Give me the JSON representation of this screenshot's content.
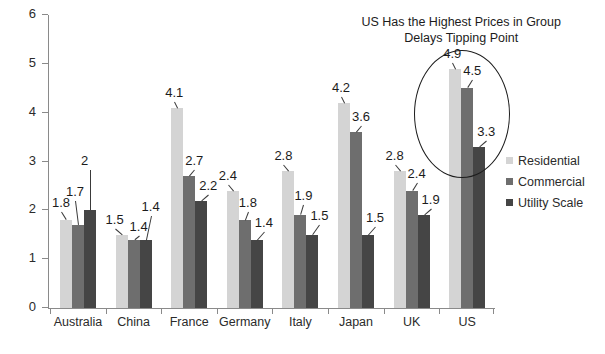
{
  "chart_data": {
    "type": "bar",
    "title": "",
    "xlabel": "",
    "ylabel": "",
    "ylim": [
      0,
      6
    ],
    "ytick_labels": [
      "0",
      "1",
      "2",
      "3",
      "4",
      "5",
      "6"
    ],
    "ytick_values": [
      0,
      1,
      2,
      3,
      4,
      5,
      6
    ],
    "grid": false,
    "legend_position": "right",
    "categories": [
      "Australia",
      "China",
      "France",
      "Germany",
      "Italy",
      "Japan",
      "UK",
      "US"
    ],
    "series": [
      {
        "name": "Residential",
        "color": "#d4d4d4",
        "values": [
          1.8,
          1.5,
          4.1,
          2.4,
          2.8,
          4.2,
          2.8,
          4.9
        ],
        "labels": [
          "1.8",
          "1.5",
          "4.1",
          "2.4",
          "2.8",
          "4.2",
          "2.8",
          "4.9"
        ]
      },
      {
        "name": "Commercial",
        "color": "#6e6e6e",
        "values": [
          1.7,
          1.4,
          2.7,
          1.8,
          1.9,
          3.6,
          2.4,
          4.5
        ],
        "labels": [
          "1.7",
          "1.4",
          "2.7",
          "1.8",
          "1.9",
          "3.6",
          "2.4",
          "4.5"
        ]
      },
      {
        "name": "Utility Scale",
        "color": "#454545",
        "values": [
          2.0,
          1.4,
          2.2,
          1.4,
          1.5,
          1.5,
          1.9,
          3.3
        ],
        "labels": [
          "2",
          "1.4",
          "2.2",
          "1.4",
          "1.5",
          "1.5",
          "1.9",
          "3.3"
        ]
      }
    ],
    "annotations": [
      {
        "name": "us-callout",
        "line1": "US Has the Highest Prices in Group",
        "line2": "Delays Tipping Point",
        "target": "US"
      }
    ]
  }
}
